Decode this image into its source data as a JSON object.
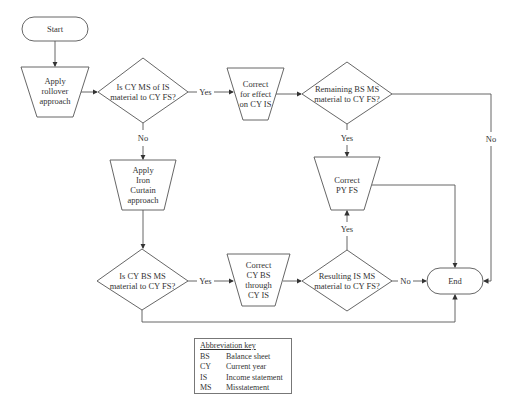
{
  "nodes": {
    "start": "Start",
    "rollover": [
      "Apply",
      "rollover",
      "approach"
    ],
    "q_cy_is": [
      "Is CY MS of IS",
      "material to CY FS?"
    ],
    "correct_effect": [
      "Correct",
      "for effect",
      "on CY IS"
    ],
    "q_remaining_bs": [
      "Remaining BS MS",
      "material to CY FS?"
    ],
    "correct_py": [
      "Correct",
      "PY FS"
    ],
    "iron_curtain": [
      "Apply",
      "Iron",
      "Curtain",
      "approach"
    ],
    "q_cy_bs": [
      "Is CY BS MS",
      "material to CY FS?"
    ],
    "correct_cy_bs": [
      "Correct",
      "CY BS",
      "through",
      "CY IS"
    ],
    "q_resulting_is": [
      "Resulting IS MS",
      "material to CY FS?"
    ],
    "end": "End"
  },
  "edges": {
    "yes1": "Yes",
    "no1": "No",
    "yes2": "Yes",
    "no2": "No",
    "yes3": "Yes",
    "yes4": "Yes",
    "no4": "No"
  },
  "key": {
    "title": "Abbreviation key",
    "items": [
      {
        "abbr": "BS",
        "meaning": "Balance sheet"
      },
      {
        "abbr": "CY",
        "meaning": "Current year"
      },
      {
        "abbr": "IS",
        "meaning": "Income statement"
      },
      {
        "abbr": "MS",
        "meaning": "Misstatement"
      }
    ]
  }
}
